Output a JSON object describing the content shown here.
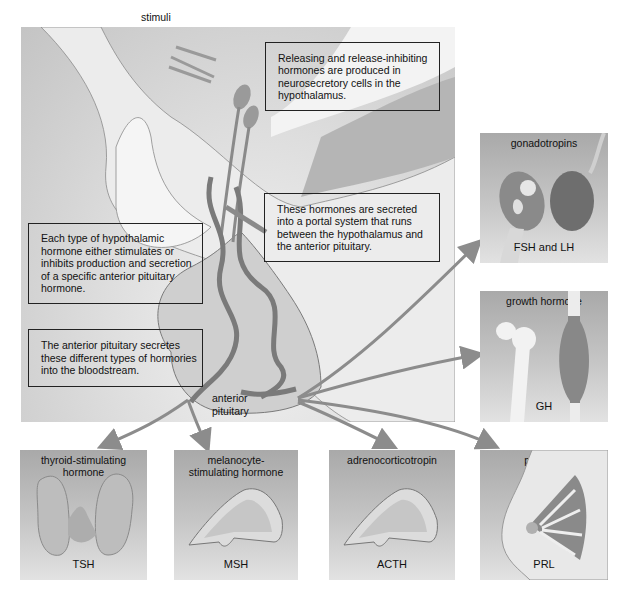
{
  "diagram": {
    "stimuli_label": "stimuli",
    "anterior_pituitary_label": [
      "anterior",
      "pituitary"
    ],
    "callouts": [
      {
        "id": "releasing",
        "lines": [
          "Releasing and release-inhibiting",
          "hormones are produced in",
          "neurosecretory cells in the",
          "hypothalamus."
        ]
      },
      {
        "id": "portal",
        "lines": [
          "These hormones are secreted",
          "into a portal system that runs",
          "between the hypothalamus and",
          "the anterior pituitary."
        ]
      },
      {
        "id": "each-type",
        "lines": [
          "Each type of hypothalamic",
          "hormone either stimulates or",
          "inhibits production and secretion",
          "of a specific anterior pituitary",
          "hormone."
        ]
      },
      {
        "id": "secretes",
        "lines": [
          "The anterior pituitary secretes",
          "these different types of hormories",
          "into the bloodstream."
        ]
      }
    ],
    "hormones": [
      {
        "id": "gonadotropins",
        "title": "gonadotropins",
        "abbr": "FSH and LH",
        "target": "ovary and testis"
      },
      {
        "id": "growth-hormone",
        "title": "growth hormone",
        "abbr": "GH",
        "target": "bone and muscle"
      },
      {
        "id": "tsh",
        "title": "thyroid-stimulating hormone",
        "title_lines": [
          "thyroid-stimulating",
          "hormone"
        ],
        "abbr": "TSH",
        "target": "thyroid gland"
      },
      {
        "id": "msh",
        "title": "melanocyte-stimulating hormone",
        "title_lines": [
          "melanocyte-",
          "stimulating hormone"
        ],
        "abbr": "MSH",
        "target": "skin"
      },
      {
        "id": "acth",
        "title": "adrenocorticotropin",
        "abbr": "ACTH",
        "target": "adrenal gland"
      },
      {
        "id": "prolactin",
        "title": "prolactin",
        "abbr": "PRL",
        "target": "mammary gland"
      }
    ],
    "colors": {
      "panel_dark": "#a9a9a9",
      "panel_light": "#e2e2e2",
      "arrow": "#8c8c8c",
      "vessel": "#7a7a7a"
    }
  }
}
